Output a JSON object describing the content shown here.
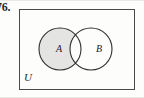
{
  "figure": {
    "type": "venn-diagram",
    "exercise_number": "76.",
    "universal_set_label": "U",
    "sets": [
      {
        "name": "A",
        "label": "A",
        "shaded": true,
        "fill_color": "#e4e4e2",
        "stroke_color": "#2f2f2f"
      },
      {
        "name": "B",
        "label": "B",
        "shaded": false,
        "fill_color": "#ffffff",
        "stroke_color": "#2f2f2f"
      }
    ],
    "regions": {
      "a_only": {
        "shaded": true,
        "fill_color": "#e4e4e2"
      },
      "intersection": {
        "shaded": false,
        "fill_color": "#ffffff"
      },
      "b_only": {
        "shaded": false,
        "fill_color": "#ffffff"
      },
      "outside": {
        "shaded": false,
        "fill_color": "#fdfdfc"
      }
    },
    "geometry": {
      "rect": {
        "x": 0,
        "y": 0,
        "width": 116,
        "height": 81
      },
      "circle_a": {
        "cx": 41,
        "cy": 40,
        "r": 21
      },
      "circle_b": {
        "cx": 72,
        "cy": 40,
        "r": 21
      }
    },
    "colors": {
      "rect_stroke": "#4a4a4a",
      "circle_stroke": "#2f2f2f",
      "shade": "#e4e4e2",
      "background": "#fdfdfc",
      "text": "#2b2b2b"
    }
  }
}
